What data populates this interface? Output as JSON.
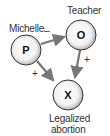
{
  "nodes": {
    "p": {
      "letter": "P",
      "label": "Michelle"
    },
    "o": {
      "letter": "O",
      "label": "Teacher"
    },
    "x": {
      "letter": "X",
      "label_line1": "Legalized",
      "label_line2": "abortion"
    }
  },
  "relations": {
    "p_to_o": "–",
    "p_to_x": "+",
    "o_to_x": "+"
  },
  "colors": {
    "arrow": "#777777",
    "node_fill": "#f2f2f2",
    "node_rim": "#9a9a9a"
  }
}
